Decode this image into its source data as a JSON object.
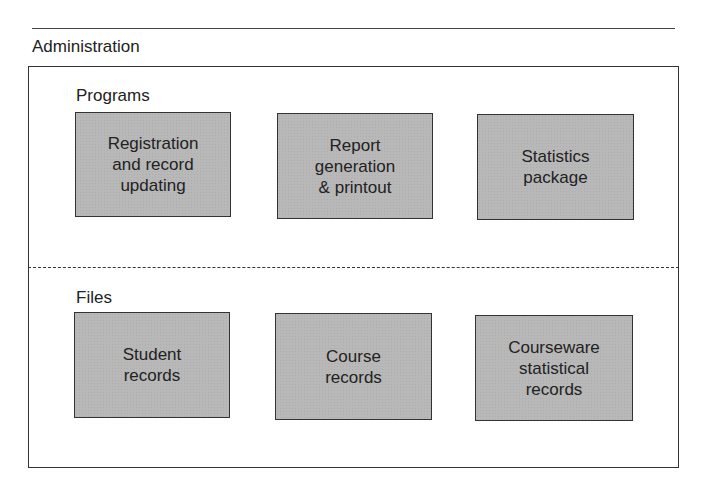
{
  "diagram": {
    "title": "Administration",
    "sections": [
      {
        "label": "Programs",
        "boxes": [
          {
            "label": "Registration\nand record\nupdating"
          },
          {
            "label": "Report\ngeneration\n& printout"
          },
          {
            "label": "Statistics\npackage"
          }
        ]
      },
      {
        "label": "Files",
        "boxes": [
          {
            "label": "Student\nrecords"
          },
          {
            "label": "Course\nrecords"
          },
          {
            "label": "Courseware\nstatistical\nrecords"
          }
        ]
      }
    ],
    "colors": {
      "box_fill": "#b8b8b8",
      "border": "#333333"
    }
  }
}
